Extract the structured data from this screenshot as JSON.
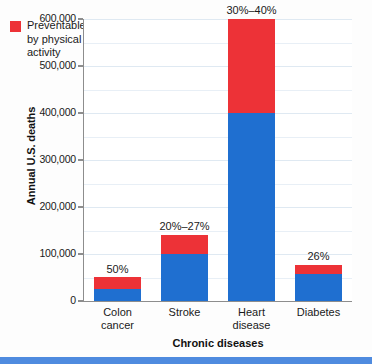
{
  "chart_data": {
    "type": "bar",
    "stacked": true,
    "title": "",
    "xlabel": "Chronic diseases",
    "ylabel": "Annual U.S. deaths",
    "categories": [
      "Colon cancer",
      "Stroke",
      "Heart disease",
      "Diabetes"
    ],
    "category_lines": [
      [
        "Colon",
        "cancer"
      ],
      [
        "Stroke"
      ],
      [
        "Heart",
        "disease"
      ],
      [
        "Diabetes"
      ]
    ],
    "series": [
      {
        "name": "Not preventable by physical activity",
        "color": "#1f6fd0",
        "values": [
          25000,
          100000,
          400000,
          57000
        ]
      },
      {
        "name": "Preventable by physical activity",
        "color": "#ed3237",
        "values": [
          25000,
          40000,
          200000,
          20000
        ]
      }
    ],
    "totals": [
      50000,
      140000,
      600000,
      77000
    ],
    "annotations": [
      "50%",
      "20%–27%",
      "30%–40%",
      "26%"
    ],
    "ylim": [
      0,
      600000
    ],
    "ytick_values": [
      0,
      100000,
      200000,
      300000,
      400000,
      500000,
      600000
    ],
    "ytick_labels": [
      "0",
      "100,000",
      "200,000",
      "300,000",
      "400,000",
      "500,000",
      "600,000"
    ],
    "minor_gridline_step": 50000,
    "grid": true,
    "legend_position": "top-left"
  },
  "legend": {
    "entries": [
      {
        "label": "Preventable\nby physical\nactivity",
        "color": "#ed3237"
      }
    ]
  },
  "colors": {
    "blue_series": "#1f6fd0",
    "red_series": "#ed3237",
    "axis": "#8d8d8d",
    "gridline": "#e8eff6",
    "bottom_band": "#4f8bdf",
    "text": "#1a1a1a"
  }
}
